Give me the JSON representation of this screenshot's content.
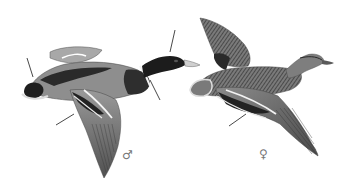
{
  "figure": {
    "birds": [
      {
        "sex": "male",
        "symbol": "♂",
        "position": "left"
      },
      {
        "sex": "female",
        "symbol": "♀",
        "position": "right"
      }
    ],
    "pointer_lines": 6
  },
  "colors": {
    "background": "#ffffff",
    "dark_plumage": "#1e1e1e",
    "mid_plumage": "#6a6a6a",
    "light_plumage": "#b8b8b8",
    "speculum": "#2a2a2a",
    "bill": "#cfcfcf",
    "pointer": "#333333"
  }
}
